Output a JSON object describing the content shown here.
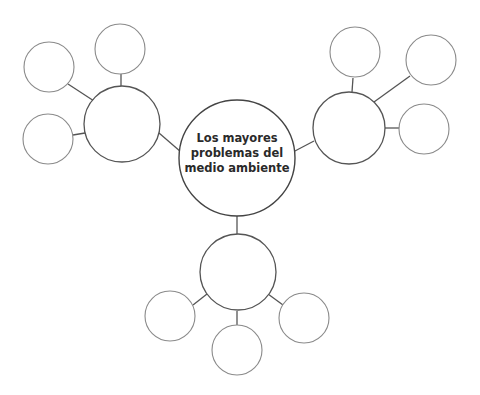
{
  "diagram": {
    "type": "bubble-map",
    "central_topic": {
      "lines": [
        "Los mayores",
        "problemas del",
        "medio ambiente"
      ]
    },
    "colors": {
      "background": "#ffffff",
      "main_stroke": "#555555",
      "small_stroke": "#8a8a8a",
      "connector": "#555555",
      "text": "#2a2a2a"
    },
    "branches": [
      {
        "name": "left",
        "children": 3
      },
      {
        "name": "right",
        "children": 3
      },
      {
        "name": "bottom",
        "children": 3
      }
    ]
  }
}
